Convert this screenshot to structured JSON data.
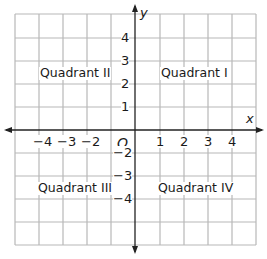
{
  "diagram": {
    "title": "",
    "axes": {
      "x_label": "x",
      "y_label": "y",
      "origin_label": "O",
      "x_ticks": [
        "−4",
        "−3",
        "−2",
        "1",
        "2",
        "3",
        "4"
      ],
      "y_ticks": [
        "4",
        "3",
        "2",
        "1",
        "−2",
        "−3",
        "−4"
      ]
    },
    "quadrants": {
      "q1": "Quadrant I",
      "q2": "Quadrant II",
      "q3": "Quadrant III",
      "q4": "Quadrant IV"
    },
    "grid": {
      "columns": 10,
      "rows": 10
    },
    "colors": {
      "grid": "#b8b8b8",
      "axis": "#222222",
      "text": "#1a1a1a"
    }
  }
}
